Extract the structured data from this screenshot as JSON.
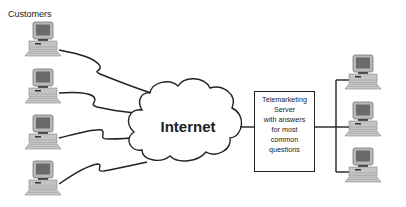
{
  "diagram": {
    "title": "Customers",
    "cloud_label": "Internet",
    "server_label_lines": [
      "Telemarketing",
      "Server",
      "with answers",
      "for most",
      "common",
      "questions"
    ],
    "left_computers": [
      {
        "id": "customer-1",
        "role": "customer computer"
      },
      {
        "id": "customer-2",
        "role": "customer computer"
      },
      {
        "id": "customer-3",
        "role": "customer computer"
      },
      {
        "id": "customer-4",
        "role": "customer computer"
      }
    ],
    "right_computers": [
      {
        "id": "agent-1",
        "role": "telemarketing workstation"
      },
      {
        "id": "agent-2",
        "role": "telemarketing workstation"
      },
      {
        "id": "agent-3",
        "role": "telemarketing workstation"
      }
    ],
    "connections": [
      "customer-1 -> Internet",
      "customer-2 -> Internet",
      "customer-3 -> Internet",
      "customer-4 -> Internet",
      "Internet -> Telemarketing Server",
      "Telemarketing Server -> agent-1",
      "Telemarketing Server -> agent-2",
      "Telemarketing Server -> agent-3"
    ]
  }
}
